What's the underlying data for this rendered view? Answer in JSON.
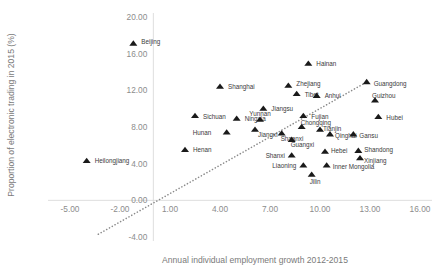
{
  "chart_data": {
    "type": "scatter",
    "title": "",
    "xlabel": "Annual individual employment growth 2012-2015",
    "ylabel": "Proportion of electronic trading in 2015 (%)",
    "xlim": [
      -5.0,
      16.0
    ],
    "ylim": [
      -4.0,
      20.0
    ],
    "xticks": [
      "-5.00",
      "-2.00",
      "1.00",
      "4.00",
      "7.00",
      "10.00",
      "13.00",
      "16.00"
    ],
    "xtick_values": [
      -5.0,
      -2.0,
      1.0,
      4.0,
      7.0,
      10.0,
      13.0,
      16.0
    ],
    "yticks": [
      "-4.00",
      "0.00",
      "4.00",
      "8.00",
      "12.00",
      "16.00",
      "20.00"
    ],
    "ytick_values": [
      -4.0,
      0.0,
      4.0,
      8.0,
      12.0,
      16.0,
      20.0
    ],
    "grid": false,
    "legend": "none",
    "marker_shape": "triangle",
    "marker_color": "#1a1a1a",
    "trendline": {
      "style": "dotted",
      "color": "#8a8a8a",
      "x_start": -3.3,
      "y_start": -3.7,
      "x_end": 12.7,
      "y_end": 12.8
    },
    "points": [
      {
        "label": "Beijing",
        "x": -1.2,
        "y": 17.1,
        "label_dx": 8,
        "label_dy": -1
      },
      {
        "label": "Heilongjiang",
        "x": -4.0,
        "y": 4.3,
        "label_dx": 8,
        "label_dy": 1
      },
      {
        "label": "Shanghai",
        "x": 4.0,
        "y": 12.4,
        "label_dx": 8,
        "label_dy": 1
      },
      {
        "label": "Hainan",
        "x": 9.3,
        "y": 14.9,
        "label_dx": 8,
        "label_dy": 1
      },
      {
        "label": "Zhejiang",
        "x": 8.1,
        "y": 12.5,
        "label_dx": 8,
        "label_dy": -1
      },
      {
        "label": "Tibet",
        "x": 8.6,
        "y": 11.6,
        "label_dx": 8,
        "label_dy": 1
      },
      {
        "label": "Anhui",
        "x": 9.8,
        "y": 11.4,
        "label_dx": 8,
        "label_dy": 1
      },
      {
        "label": "Sichuan",
        "x": 2.5,
        "y": 9.2,
        "label_dx": 8,
        "label_dy": 1
      },
      {
        "label": "Ningxia",
        "x": 5.0,
        "y": 8.9,
        "label_dx": 8,
        "label_dy": 1
      },
      {
        "label": "Jiangsu",
        "x": 6.6,
        "y": 10.0,
        "label_dx": 8,
        "label_dy": 1
      },
      {
        "label": "Yunnan",
        "x": 6.4,
        "y": 8.8,
        "label_dx": 0,
        "label_dy": -5
      },
      {
        "label": "Fujian",
        "x": 9.0,
        "y": 9.2,
        "label_dx": 8,
        "label_dy": 1
      },
      {
        "label": "Jiangxi",
        "x": 6.1,
        "y": 7.7,
        "label_dx": 3,
        "label_dy": 6
      },
      {
        "label": "Hunan",
        "x": 4.4,
        "y": 7.4,
        "label_dx": -34,
        "label_dy": 1
      },
      {
        "label": "Shaanxi",
        "x": 7.7,
        "y": 7.3,
        "label_dx": -1,
        "label_dy": 6
      },
      {
        "label": "Chongqing",
        "x": 8.9,
        "y": 8.0,
        "label_dx": -1,
        "label_dy": -4
      },
      {
        "label": "Tianjin",
        "x": 10.0,
        "y": 7.7,
        "label_dx": 3,
        "label_dy": 0
      },
      {
        "label": "Qinghai",
        "x": 10.6,
        "y": 7.2,
        "label_dx": 5,
        "label_dy": 2
      },
      {
        "label": "Gansu",
        "x": 12.0,
        "y": 7.2,
        "label_dx": 6,
        "label_dy": 2
      },
      {
        "label": "Guangxi",
        "x": 8.3,
        "y": 6.6,
        "label_dx": -1,
        "label_dy": 6
      },
      {
        "label": "Guangdong",
        "x": 12.8,
        "y": 12.9,
        "label_dx": 7,
        "label_dy": 2
      },
      {
        "label": "Guizhou",
        "x": 13.3,
        "y": 10.9,
        "label_dx": -3,
        "label_dy": -4
      },
      {
        "label": "Hubei",
        "x": 13.5,
        "y": 9.1,
        "label_dx": 8,
        "label_dy": 2
      },
      {
        "label": "Henan",
        "x": 1.9,
        "y": 5.5,
        "label_dx": 8,
        "label_dy": 1
      },
      {
        "label": "Shanxi",
        "x": 8.3,
        "y": 4.9,
        "label_dx": -26,
        "label_dy": 1
      },
      {
        "label": "Hebei",
        "x": 10.3,
        "y": 5.3,
        "label_dx": 6,
        "label_dy": 0
      },
      {
        "label": "Shandong",
        "x": 12.3,
        "y": 5.4,
        "label_dx": 6,
        "label_dy": 0
      },
      {
        "label": "Xinjiang",
        "x": 12.4,
        "y": 4.6,
        "label_dx": 4,
        "label_dy": 3
      },
      {
        "label": "Liaoning",
        "x": 9.0,
        "y": 3.8,
        "label_dx": -31,
        "label_dy": 1
      },
      {
        "label": "Inner Mongolia",
        "x": 10.4,
        "y": 3.8,
        "label_dx": 6,
        "label_dy": 2
      },
      {
        "label": "Jilin",
        "x": 9.5,
        "y": 2.8,
        "label_dx": -2,
        "label_dy": 8
      }
    ]
  }
}
